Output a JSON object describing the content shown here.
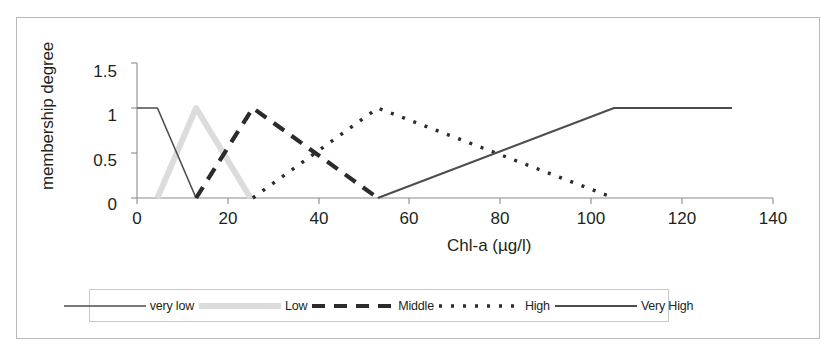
{
  "chart_data": {
    "type": "line",
    "title": "",
    "subtitle": "",
    "xlabel": "Chl-a (µg/l)",
    "ylabel": "membership degree",
    "xlim": [
      0,
      140
    ],
    "ylim": [
      0,
      1.5
    ],
    "xticks": [
      0,
      20,
      40,
      60,
      80,
      100,
      120,
      140
    ],
    "yticks": [
      0,
      0.5,
      1,
      1.5
    ],
    "xtick_labels": [
      "0",
      "20",
      "40",
      "60",
      "80",
      "100",
      "120",
      "140"
    ],
    "ytick_labels": [
      "0",
      "0.5",
      "1",
      "1.5"
    ],
    "grid": false,
    "legend_position": "below",
    "series": [
      {
        "name": "very low",
        "style": "solid-thin",
        "color": "#4d4d4d",
        "x": [
          0,
          4.5,
          13
        ],
        "y": [
          1,
          1,
          0
        ]
      },
      {
        "name": "Low",
        "style": "solid-thick-light",
        "color": "#dcdcdc",
        "x": [
          4.5,
          13,
          25
        ],
        "y": [
          0,
          1,
          0
        ]
      },
      {
        "name": "Middle",
        "style": "dashed",
        "color": "#2b2b2b",
        "x": [
          13,
          25.5,
          53
        ],
        "y": [
          0,
          1,
          0
        ]
      },
      {
        "name": "High",
        "style": "dotted",
        "color": "#2b2b2b",
        "x": [
          25.5,
          53,
          105
        ],
        "y": [
          0,
          1,
          0
        ]
      },
      {
        "name": "Very High",
        "style": "solid",
        "color": "#4d4d4d",
        "x": [
          53,
          105,
          131
        ],
        "y": [
          0,
          1,
          1
        ]
      }
    ]
  },
  "legend": {
    "items": [
      {
        "label": "very low",
        "style": "solid-thin",
        "color": "#4d4d4d"
      },
      {
        "label": "Low",
        "style": "solid-thick-light",
        "color": "#dcdcdc"
      },
      {
        "label": "Middle",
        "style": "dashed",
        "color": "#2b2b2b"
      },
      {
        "label": "High",
        "style": "dotted",
        "color": "#2b2b2b"
      },
      {
        "label": "Very High",
        "style": "solid",
        "color": "#4d4d4d"
      }
    ]
  },
  "axes": {
    "ylabel": "membership degree",
    "xlabel": "Chl-a (µg/l)",
    "ytick_0": "0",
    "ytick_1": "0.5",
    "ytick_2": "1",
    "ytick_3": "1.5",
    "xtick_0": "0",
    "xtick_1": "20",
    "xtick_2": "40",
    "xtick_3": "60",
    "xtick_4": "80",
    "xtick_5": "100",
    "xtick_6": "120",
    "xtick_7": "140"
  },
  "colors": {
    "axis": "#8c8c8c",
    "frame": "#b9b9b9",
    "text": "#231f20"
  }
}
